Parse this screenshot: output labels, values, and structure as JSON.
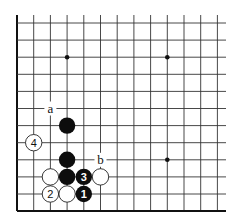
{
  "diagram": {
    "type": "go-board-fragment",
    "grid": {
      "columns": 13,
      "rows": 12,
      "col_x": [
        17,
        33.7,
        50.4,
        67.1,
        83.8,
        100.5,
        117.2,
        133.9,
        150.6,
        167.3,
        184,
        200.7,
        217.4
      ],
      "row_y": [
        23,
        40.1,
        57.2,
        74.3,
        91.4,
        108.5,
        125.6,
        142.7,
        159.8,
        176.9,
        194,
        211.1
      ],
      "open_top_y": 15,
      "open_right_x": 226,
      "left_edge": true,
      "bottom_edge": true
    },
    "star_points": [
      {
        "col": 3,
        "row": 2
      },
      {
        "col": 9,
        "row": 2
      },
      {
        "col": 9,
        "row": 8
      }
    ],
    "stones": [
      {
        "color": "black",
        "col": 3,
        "row": 6,
        "label": ""
      },
      {
        "color": "white",
        "col": 1,
        "row": 7,
        "label": "4"
      },
      {
        "color": "black",
        "col": 3,
        "row": 8,
        "label": ""
      },
      {
        "color": "white",
        "col": 2,
        "row": 9,
        "label": ""
      },
      {
        "color": "black",
        "col": 3,
        "row": 9,
        "label": ""
      },
      {
        "color": "black",
        "col": 4,
        "row": 9,
        "label": "3"
      },
      {
        "color": "white",
        "col": 5,
        "row": 9,
        "label": ""
      },
      {
        "color": "white",
        "col": 2,
        "row": 10,
        "label": "2"
      },
      {
        "color": "white",
        "col": 3,
        "row": 10,
        "label": ""
      },
      {
        "color": "black",
        "col": 4,
        "row": 10,
        "label": "1"
      }
    ],
    "point_labels": [
      {
        "text": "a",
        "col": 2,
        "row": 5
      },
      {
        "text": "b",
        "col": 5,
        "row": 8
      }
    ],
    "colors": {
      "black_stone": "#0d0d0d",
      "white_stone": "#ffffff",
      "line": "#333333",
      "background": "#ffffff"
    }
  }
}
